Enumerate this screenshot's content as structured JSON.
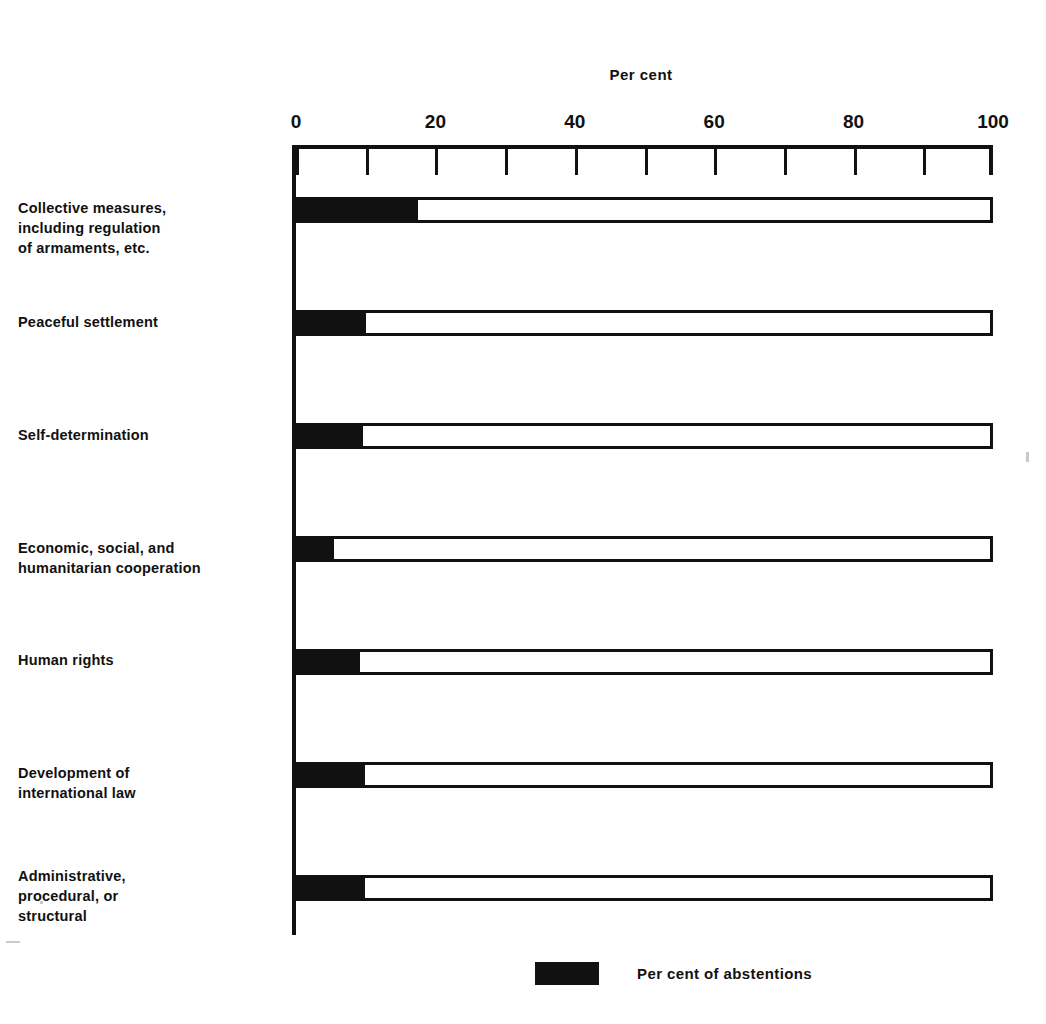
{
  "chart_data": {
    "type": "bar",
    "orientation": "horizontal",
    "title": "",
    "xlabel": "Per cent",
    "ylabel": "",
    "xlim": [
      0,
      100
    ],
    "grid": false,
    "tick_step": 10,
    "labeled_ticks": [
      "0",
      "20",
      "40",
      "60",
      "80",
      "100"
    ],
    "legend_position": "bottom-center",
    "categories": [
      "Collective measures, including regulation of armaments, etc.",
      "Peaceful settlement",
      "Self-determination",
      "Economic, social, and humanitarian cooperation",
      "Human rights",
      "Development of international law",
      "Administrative, procedural, or structural"
    ],
    "series": [
      {
        "name": "Per cent of abstentions",
        "color": "#111111",
        "values": [
          17.5,
          10.0,
          9.6,
          5.5,
          9.2,
          9.9,
          9.9
        ]
      },
      {
        "name": "Remainder (to 100 per cent)",
        "color": "#ffffff",
        "values": [
          82.5,
          90.0,
          90.4,
          94.5,
          90.8,
          90.1,
          90.1
        ]
      }
    ]
  },
  "axis": {
    "title": "Per cent",
    "ticks": [
      {
        "value": 0,
        "label": "0"
      },
      {
        "value": 10,
        "label": ""
      },
      {
        "value": 20,
        "label": "20"
      },
      {
        "value": 30,
        "label": ""
      },
      {
        "value": 40,
        "label": "40"
      },
      {
        "value": 50,
        "label": ""
      },
      {
        "value": 60,
        "label": "60"
      },
      {
        "value": 70,
        "label": ""
      },
      {
        "value": 80,
        "label": "80"
      },
      {
        "value": 90,
        "label": ""
      },
      {
        "value": 100,
        "label": "100"
      }
    ]
  },
  "bars": [
    {
      "label_lines": [
        "Collective measures,",
        "including regulation",
        "of armaments, etc."
      ],
      "abstentions": 17.5,
      "total": 100
    },
    {
      "label_lines": [
        "Peaceful settlement"
      ],
      "abstentions": 10.0,
      "total": 100
    },
    {
      "label_lines": [
        "Self-determination"
      ],
      "abstentions": 9.6,
      "total": 100
    },
    {
      "label_lines": [
        "Economic, social, and",
        "humanitarian cooperation"
      ],
      "abstentions": 5.5,
      "total": 100
    },
    {
      "label_lines": [
        "Human rights"
      ],
      "abstentions": 9.2,
      "total": 100
    },
    {
      "label_lines": [
        "Development of",
        "international law"
      ],
      "abstentions": 9.9,
      "total": 100
    },
    {
      "label_lines": [
        "Administrative,",
        "procedural, or",
        "structural"
      ],
      "abstentions": 9.9,
      "total": 100
    }
  ],
  "legend": {
    "items": [
      {
        "swatch_color": "#111111",
        "label": "Per cent of abstentions"
      }
    ]
  },
  "geometry": {
    "bar_tops": [
      52,
      165,
      278,
      391,
      504,
      617,
      730
    ],
    "label_tops": [
      198,
      312,
      425,
      538,
      650,
      763,
      866
    ],
    "bar_height": 26
  }
}
